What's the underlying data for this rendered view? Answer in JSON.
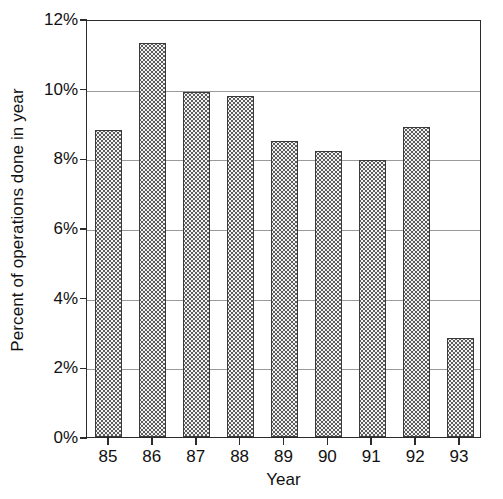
{
  "chart_data": {
    "type": "bar",
    "title": "",
    "xlabel": "Year",
    "ylabel": "Percent of operations done in year",
    "categories": [
      "85",
      "86",
      "87",
      "88",
      "89",
      "90",
      "91",
      "92",
      "93"
    ],
    "values": [
      8.8,
      11.3,
      9.9,
      9.8,
      8.5,
      8.2,
      7.95,
      8.9,
      2.85
    ],
    "ylim": [
      0,
      12
    ],
    "ytick_values": [
      0,
      2,
      4,
      6,
      8,
      10,
      12
    ],
    "ytick_labels": [
      "0%",
      "2%",
      "4%",
      "6%",
      "8%",
      "10%",
      "12%"
    ],
    "xtick_labels": [
      "85",
      "86",
      "87",
      "88",
      "89",
      "90",
      "91",
      "92",
      "93"
    ],
    "grid": true,
    "grid_axis": "y",
    "legend": false,
    "legend_position": "none",
    "bar_fill": "stippled-dot-pattern",
    "bar_fill_color": "#f2f2f2",
    "bar_edge_color": "#3a3a3a",
    "axis_color": "#2b2b2b",
    "grid_color": "#9a9a9a",
    "background_color": "#ffffff",
    "units": "percent"
  }
}
